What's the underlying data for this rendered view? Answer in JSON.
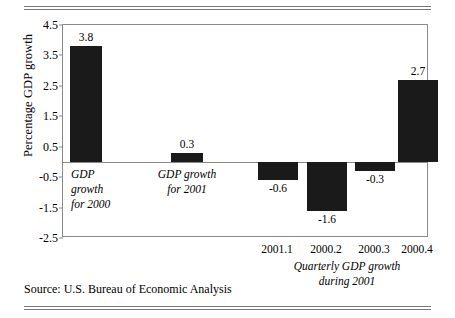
{
  "figure": {
    "source_text": "Source: U.S. Bureau of Economic Analysis",
    "ylabel": "Percentage GDP growth"
  },
  "chart_data": {
    "type": "bar",
    "title": "",
    "xlabel": "",
    "ylabel": "Percentage GDP growth",
    "ylim": [
      -2.5,
      4.5
    ],
    "ytick_labels": [
      "4.5",
      "3.5",
      "2.5",
      "1.5",
      "0.5",
      "-0.5",
      "-1.5",
      "-2.5"
    ],
    "yticks": [
      4.5,
      3.5,
      2.5,
      1.5,
      0.5,
      -0.5,
      -1.5,
      -2.5
    ],
    "grid": false,
    "legend": "none",
    "bar_color": "#1a1a1a",
    "categories": [
      "",
      "",
      "2001.1",
      "2000.2",
      "2000.3",
      "2000.4"
    ],
    "values": [
      3.8,
      0.3,
      -0.6,
      -1.6,
      -0.3,
      2.7
    ],
    "value_labels": [
      "3.8",
      "0.3",
      "-0.6",
      "-1.6",
      "-0.3",
      "2.7"
    ],
    "xtick_labels": [
      "2001.1",
      "2000.2",
      "2000.3",
      "2000.4"
    ],
    "annotations": [
      {
        "text": "GDP\ngrowth\nfor 2000"
      },
      {
        "text": "GDP growth\nfor 2001"
      },
      {
        "text": "Quarterly GDP growth\nduring 2001"
      }
    ]
  }
}
